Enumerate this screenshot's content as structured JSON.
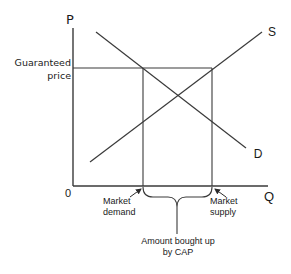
{
  "diagram": {
    "title": "",
    "axes": {
      "y_label": "P",
      "x_label": "Q",
      "origin_label": "0"
    },
    "curves": {
      "supply_label": "S",
      "demand_label": "D"
    },
    "price_line": {
      "label_line1": "Guaranteed",
      "label_line2": "price"
    },
    "annotations": {
      "market_demand_line1": "Market",
      "market_demand_line2": "demand",
      "market_supply_line1": "Market",
      "market_supply_line2": "supply",
      "surplus_line1": "Amount bought up",
      "surplus_line2": "by CAP"
    },
    "colors": {
      "line": "#3a3a3a",
      "text": "#1a1a1a",
      "background": "#ffffff"
    }
  }
}
